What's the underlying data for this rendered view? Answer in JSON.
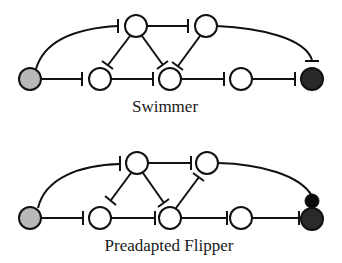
{
  "diagrams": [
    {
      "id": "swimmer",
      "label": "Swimmer",
      "node_radius": 11,
      "nodes": [
        {
          "id": "sensory",
          "x": 30,
          "y": 79,
          "fill": "gray"
        },
        {
          "id": "b1",
          "x": 100,
          "y": 79,
          "fill": "open"
        },
        {
          "id": "b2",
          "x": 170,
          "y": 79,
          "fill": "open"
        },
        {
          "id": "b3",
          "x": 241,
          "y": 79,
          "fill": "open"
        },
        {
          "id": "motor",
          "x": 312,
          "y": 79,
          "fill": "black"
        },
        {
          "id": "t1",
          "x": 136,
          "y": 26,
          "fill": "open"
        },
        {
          "id": "t2",
          "x": 206,
          "y": 26,
          "fill": "open"
        }
      ],
      "edges": [
        {
          "from": "sensory",
          "to": "b1",
          "type": "inhibit"
        },
        {
          "from": "b1",
          "to": "b2",
          "type": "inhibit"
        },
        {
          "from": "b2",
          "to": "b3",
          "type": "inhibit"
        },
        {
          "from": "b3",
          "to": "motor",
          "type": "inhibit"
        },
        {
          "from": "t1",
          "to": "t2",
          "type": "inhibit"
        },
        {
          "from": "t1",
          "to": "b1",
          "type": "inhibit"
        },
        {
          "from": "t1",
          "to": "b2",
          "type": "inhibit"
        },
        {
          "from": "t2",
          "to": "b2",
          "type": "inhibit"
        },
        {
          "from": "sensory",
          "to": "t1",
          "type": "inhibit",
          "curved": true
        },
        {
          "from": "t2",
          "to": "motor",
          "type": "inhibit",
          "curved": true
        }
      ]
    },
    {
      "id": "preadapted-flipper",
      "label": "Preadapted Flipper",
      "node_radius": 11,
      "nodes": [
        {
          "id": "sensory",
          "x": 30,
          "y": 218,
          "fill": "gray"
        },
        {
          "id": "b1",
          "x": 100,
          "y": 218,
          "fill": "open"
        },
        {
          "id": "b2",
          "x": 170,
          "y": 218,
          "fill": "open"
        },
        {
          "id": "b3",
          "x": 241,
          "y": 218,
          "fill": "open"
        },
        {
          "id": "motor",
          "x": 312,
          "y": 218,
          "fill": "black"
        },
        {
          "id": "motor-extra",
          "x": 312,
          "y": 201,
          "fill": "tiny"
        },
        {
          "id": "t1",
          "x": 137,
          "y": 163,
          "fill": "open"
        },
        {
          "id": "t2",
          "x": 207,
          "y": 163,
          "fill": "open"
        }
      ],
      "edges": [
        {
          "from": "sensory",
          "to": "b1",
          "type": "inhibit"
        },
        {
          "from": "b1",
          "to": "b2",
          "type": "inhibit"
        },
        {
          "from": "b2",
          "to": "b3",
          "type": "inhibit"
        },
        {
          "from": "b3",
          "to": "motor",
          "type": "inhibit"
        },
        {
          "from": "t1",
          "to": "t2",
          "type": "inhibit"
        },
        {
          "from": "t1",
          "to": "b1",
          "type": "inhibit"
        },
        {
          "from": "t1",
          "to": "b2",
          "type": "inhibit"
        },
        {
          "from": "b2",
          "to": "t2",
          "type": "inhibit"
        },
        {
          "from": "sensory",
          "to": "t1",
          "type": "inhibit",
          "curved": true
        },
        {
          "from": "t2",
          "to": "motor-extra",
          "type": "excite",
          "curved": true
        }
      ]
    }
  ],
  "colors": {
    "stroke": "#111111",
    "sensory_fill": "#b8b8b8",
    "motor_fill": "#2a2a2a",
    "open_fill": "#ffffff"
  }
}
